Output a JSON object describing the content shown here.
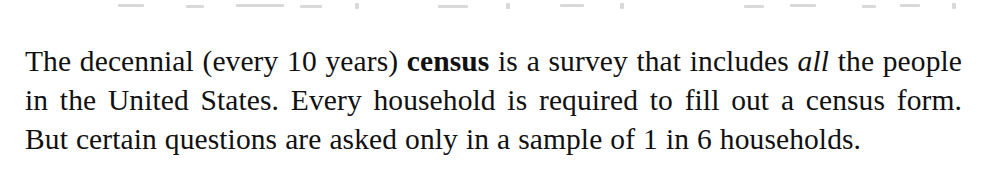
{
  "document": {
    "paragraph": {
      "segments": [
        {
          "text": "The decennial (every 10 years) ",
          "style": "normal"
        },
        {
          "text": "census",
          "style": "bold"
        },
        {
          "text": " is a survey that includes ",
          "style": "normal"
        },
        {
          "text": "all",
          "style": "italic"
        },
        {
          "text": " the people in the United States. Every household is required to fill out a census form. But certain questions are asked only in a sample of 1 in 6 households.",
          "style": "normal"
        }
      ],
      "part_1": "The decennial (every 10 years) ",
      "bold_term": "census",
      "part_2": " is a survey that includes ",
      "italic_term": "all",
      "part_3": " the people in the United States. Every household is required to fill out a census form. But certain questions are asked only in a sample of 1 in 6 households.",
      "full_text": "The decennial (every 10 years) census is a survey that includes all the people in the United States. Every household is required to fill out a census form. But certain questions are asked only in a sample of 1 in 6 households.",
      "lines": [
        "The decennial (every 10 years) census is a survey that includes",
        "all the people in the United States. Every household is required",
        "to fill out a census form. But certain questions are asked only in",
        "a sample of 1 in 6 households."
      ]
    },
    "colors": {
      "text": "#111111",
      "background": "#ffffff",
      "artifact": "#d9d9d9"
    }
  }
}
